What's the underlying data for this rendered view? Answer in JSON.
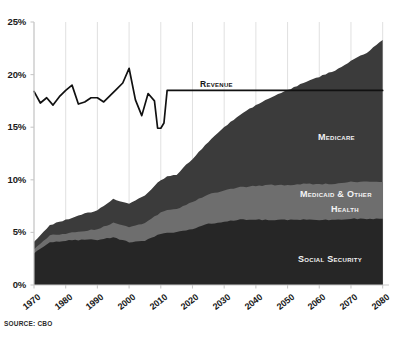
{
  "source_note": "Source: CBO",
  "axes": {
    "y_ticks": [
      "0%",
      "5%",
      "10%",
      "15%",
      "20%",
      "25%"
    ],
    "x_ticks": [
      "1970",
      "1980",
      "1990",
      "2000",
      "2010",
      "2020",
      "2030",
      "2040",
      "2050",
      "2060",
      "2070",
      "2080"
    ]
  },
  "labels": {
    "revenue": "Revenue",
    "medicare": "Medicare",
    "medicaid_line1": "Medicaid & Other",
    "medicaid_line2": "Health",
    "social_security": "Social Security"
  },
  "colors": {
    "social_security": "#262626",
    "medicaid_other_health": "#6e6e6e",
    "medicare": "#3b3b3b",
    "revenue_line": "#111111",
    "axis": "#c9c9c9",
    "gridline": "#d8d8d8",
    "background": "#ffffff"
  },
  "chart_data": {
    "type": "area",
    "title": "",
    "subtitle": "",
    "xlabel": "",
    "ylabel": "",
    "xlim": [
      1970,
      2082
    ],
    "ylim": [
      0,
      25
    ],
    "y_unit": "percent of GDP",
    "grid": true,
    "legend": "inline-annotations",
    "x": [
      1970,
      1975,
      1980,
      1985,
      1990,
      1995,
      2000,
      2005,
      2010,
      2012,
      2015,
      2020,
      2025,
      2030,
      2035,
      2040,
      2045,
      2050,
      2055,
      2060,
      2065,
      2070,
      2075,
      2080
    ],
    "series": [
      {
        "name": "Social Security",
        "values": [
          3.0,
          4.1,
          4.2,
          4.3,
          4.3,
          4.5,
          4.1,
          4.2,
          4.9,
          5.0,
          5.0,
          5.3,
          5.8,
          6.0,
          6.2,
          6.2,
          6.2,
          6.2,
          6.2,
          6.2,
          6.2,
          6.3,
          6.3,
          6.3
        ]
      },
      {
        "name": "Medicaid & Other Health",
        "values": [
          0.4,
          0.6,
          0.7,
          0.8,
          1.0,
          1.4,
          1.4,
          1.7,
          2.0,
          2.1,
          2.2,
          2.6,
          2.8,
          3.0,
          3.1,
          3.2,
          3.3,
          3.3,
          3.4,
          3.4,
          3.4,
          3.5,
          3.5,
          3.5
        ]
      },
      {
        "name": "Medicare",
        "values": [
          0.7,
          1.0,
          1.3,
          1.6,
          1.8,
          2.3,
          2.2,
          2.6,
          3.1,
          3.2,
          3.3,
          4.1,
          5.0,
          6.0,
          6.9,
          7.7,
          8.4,
          9.0,
          9.6,
          10.2,
          10.8,
          11.5,
          12.3,
          13.5
        ]
      }
    ],
    "stacked_totals": [
      4.1,
      5.7,
      6.2,
      6.7,
      7.1,
      8.2,
      7.7,
      8.5,
      10.0,
      10.3,
      10.5,
      12.0,
      13.6,
      15.0,
      16.2,
      17.1,
      17.9,
      18.5,
      19.2,
      19.8,
      20.4,
      21.3,
      22.1,
      23.3
    ],
    "revenue_line": {
      "name": "Revenue",
      "x": [
        1970,
        1972,
        1974,
        1976,
        1978,
        1980,
        1982,
        1984,
        1986,
        1988,
        1990,
        1992,
        1994,
        1996,
        1998,
        2000,
        2002,
        2004,
        2006,
        2008,
        2009,
        2010,
        2011,
        2012,
        2013,
        2020,
        2040,
        2060,
        2080
      ],
      "values": [
        18.4,
        17.3,
        17.8,
        17.1,
        17.9,
        18.5,
        19.0,
        17.2,
        17.4,
        17.8,
        17.8,
        17.4,
        18.0,
        18.6,
        19.2,
        20.6,
        17.6,
        16.1,
        18.2,
        17.5,
        14.9,
        14.9,
        15.4,
        18.5,
        18.5,
        18.5,
        18.5,
        18.5,
        18.5
      ]
    }
  }
}
